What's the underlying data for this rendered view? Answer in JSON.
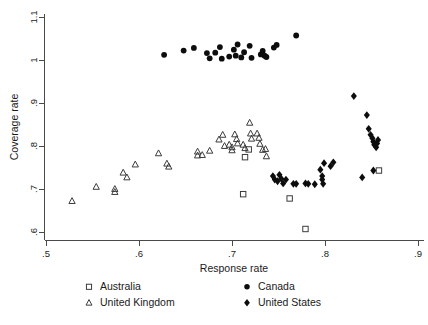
{
  "chart_data": {
    "type": "scatter",
    "title": "",
    "xlabel": "Response rate",
    "ylabel": "Coverage rate",
    "xlim": [
      0.5,
      0.9
    ],
    "ylim": [
      0.6,
      1.1
    ],
    "xticks": [
      ".5",
      ".6",
      ".7",
      ".8",
      ".9"
    ],
    "xtick_values": [
      0.5,
      0.6,
      0.7,
      0.8,
      0.9
    ],
    "yticks": [
      ".6",
      ".7",
      ".8",
      ".9",
      "1",
      "1.1"
    ],
    "ytick_values": [
      0.6,
      0.7,
      0.8,
      0.9,
      1.0,
      1.1
    ],
    "grid": false,
    "legend_position": "bottom",
    "series": [
      {
        "name": "Australia",
        "marker": "open-square",
        "color": "#3c3c3c",
        "points": [
          [
            0.714,
            0.774
          ],
          [
            0.718,
            0.792
          ],
          [
            0.712,
            0.688
          ],
          [
            0.762,
            0.678
          ],
          [
            0.779,
            0.607
          ],
          [
            0.858,
            0.743
          ]
        ]
      },
      {
        "name": "Canada",
        "marker": "filled-circle",
        "color": "#0d0d0d",
        "points": [
          [
            0.627,
            1.012
          ],
          [
            0.648,
            1.022
          ],
          [
            0.659,
            1.028
          ],
          [
            0.673,
            1.016
          ],
          [
            0.682,
            1.017
          ],
          [
            0.687,
            1.03
          ],
          [
            0.676,
            1.004
          ],
          [
            0.689,
            1.003
          ],
          [
            0.697,
            1.008
          ],
          [
            0.702,
            1.024
          ],
          [
            0.706,
            1.036
          ],
          [
            0.704,
            1.01
          ],
          [
            0.713,
            1.018
          ],
          [
            0.719,
            1.033
          ],
          [
            0.71,
            1.006
          ],
          [
            0.721,
            1.005
          ],
          [
            0.731,
            1.013
          ],
          [
            0.733,
            1.021
          ],
          [
            0.735,
            1.01
          ],
          [
            0.737,
            1.007
          ],
          [
            0.745,
            1.029
          ],
          [
            0.748,
            1.035
          ],
          [
            0.769,
            1.057
          ]
        ]
      },
      {
        "name": "United Kingdom",
        "marker": "open-triangle",
        "color": "#3c3c3c",
        "points": [
          [
            0.528,
            0.672
          ],
          [
            0.554,
            0.705
          ],
          [
            0.574,
            0.7
          ],
          [
            0.574,
            0.693
          ],
          [
            0.583,
            0.738
          ],
          [
            0.587,
            0.727
          ],
          [
            0.596,
            0.757
          ],
          [
            0.621,
            0.783
          ],
          [
            0.63,
            0.759
          ],
          [
            0.632,
            0.752
          ],
          [
            0.663,
            0.787
          ],
          [
            0.663,
            0.778
          ],
          [
            0.668,
            0.779
          ],
          [
            0.676,
            0.789
          ],
          [
            0.686,
            0.815
          ],
          [
            0.69,
            0.826
          ],
          [
            0.692,
            0.8
          ],
          [
            0.697,
            0.803
          ],
          [
            0.7,
            0.797
          ],
          [
            0.7,
            0.79
          ],
          [
            0.703,
            0.827
          ],
          [
            0.705,
            0.816
          ],
          [
            0.706,
            0.806
          ],
          [
            0.712,
            0.803
          ],
          [
            0.714,
            0.795
          ],
          [
            0.719,
            0.854
          ],
          [
            0.72,
            0.829
          ],
          [
            0.721,
            0.817
          ],
          [
            0.727,
            0.829
          ],
          [
            0.729,
            0.819
          ],
          [
            0.73,
            0.805
          ],
          [
            0.733,
            0.791
          ],
          [
            0.736,
            0.793
          ],
          [
            0.737,
            0.776
          ]
        ]
      },
      {
        "name": "United States",
        "marker": "filled-diamond",
        "color": "#0d0d0d",
        "points": [
          [
            0.744,
            0.73
          ],
          [
            0.746,
            0.722
          ],
          [
            0.749,
            0.718
          ],
          [
            0.751,
            0.733
          ],
          [
            0.753,
            0.724
          ],
          [
            0.755,
            0.713
          ],
          [
            0.758,
            0.722
          ],
          [
            0.766,
            0.712
          ],
          [
            0.769,
            0.712
          ],
          [
            0.779,
            0.713
          ],
          [
            0.782,
            0.712
          ],
          [
            0.789,
            0.711
          ],
          [
            0.795,
            0.745
          ],
          [
            0.797,
            0.73
          ],
          [
            0.797,
            0.722
          ],
          [
            0.798,
            0.712
          ],
          [
            0.799,
            0.76
          ],
          [
            0.806,
            0.753
          ],
          [
            0.809,
            0.762
          ],
          [
            0.831,
            0.916
          ],
          [
            0.84,
            0.727
          ],
          [
            0.845,
            0.872
          ],
          [
            0.847,
            0.84
          ],
          [
            0.849,
            0.826
          ],
          [
            0.851,
            0.818
          ],
          [
            0.852,
            0.81
          ],
          [
            0.853,
            0.803
          ],
          [
            0.855,
            0.797
          ],
          [
            0.856,
            0.806
          ],
          [
            0.857,
            0.814
          ],
          [
            0.852,
            0.743
          ]
        ]
      }
    ]
  },
  "legend": {
    "entries": [
      {
        "label": "Australia",
        "marker": "open-square"
      },
      {
        "label": "Canada",
        "marker": "filled-circle"
      },
      {
        "label": "United Kingdom",
        "marker": "open-triangle"
      },
      {
        "label": "United States",
        "marker": "filled-diamond"
      }
    ]
  }
}
